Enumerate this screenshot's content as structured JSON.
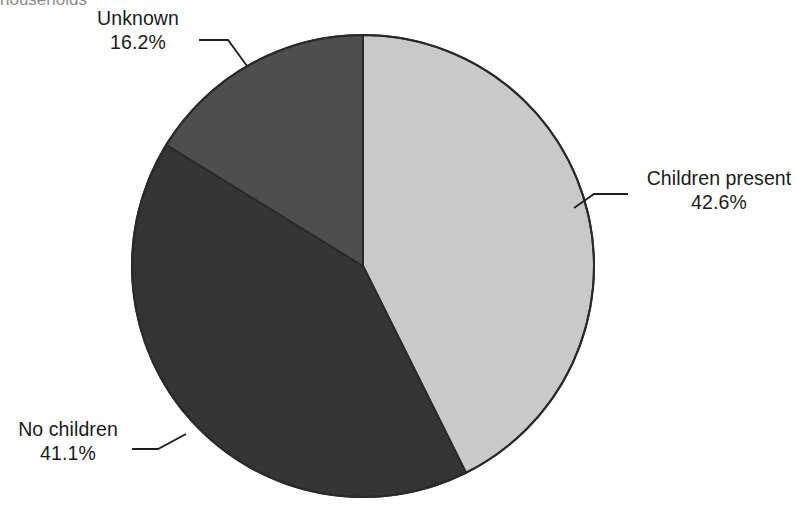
{
  "caption": {
    "fragment_text": "households"
  },
  "chart_data": {
    "type": "pie",
    "title": "",
    "subtitle": "",
    "xlabel": "",
    "ylabel": "",
    "legend_position": "none",
    "grid": false,
    "units": "percent",
    "categories": [
      "Children present",
      "No children",
      "Unknown"
    ],
    "values": [
      42.6,
      41.1,
      16.2
    ],
    "value_labels": [
      "42.6%",
      "41.1%",
      "16.2%"
    ],
    "colors": [
      "#c9c9c9",
      "#343434",
      "#4e4e4e"
    ],
    "slices": [
      {
        "name": "Children present",
        "value": 42.6,
        "value_label": "42.6%",
        "color": "#c9c9c9",
        "start_angle_deg": 0,
        "end_angle_deg": 153.36,
        "label_position": "right"
      },
      {
        "name": "No children",
        "value": 41.1,
        "value_label": "41.1%",
        "color": "#343434",
        "start_angle_deg": 153.36,
        "end_angle_deg": 301.32,
        "label_position": "lower-left"
      },
      {
        "name": "Unknown",
        "value": 16.2,
        "value_label": "16.2%",
        "color": "#4e4e4e",
        "start_angle_deg": 301.32,
        "end_angle_deg": 360,
        "label_position": "upper-left"
      }
    ],
    "geometry": {
      "center_x": 363,
      "center_y": 266,
      "radius": 231,
      "start_at_twelve_oclock": true,
      "direction": "clockwise",
      "outline_color": "#2a2a2a"
    }
  },
  "labels": {
    "children_present": {
      "name": "Children present",
      "value": "42.6%"
    },
    "no_children": {
      "name": "No children",
      "value": "41.1%"
    },
    "unknown": {
      "name": "Unknown",
      "value": "16.2%"
    }
  }
}
